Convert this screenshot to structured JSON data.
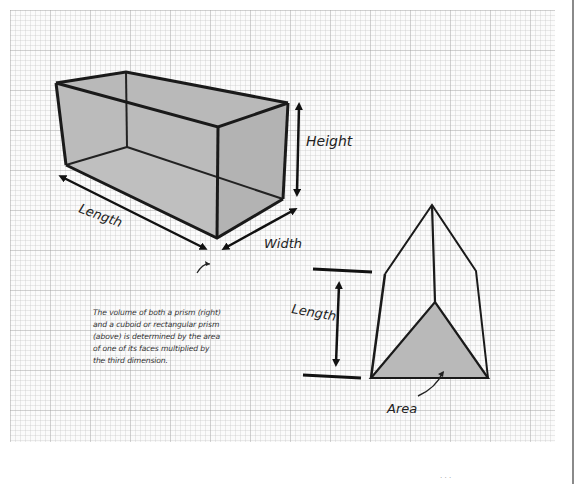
{
  "figure": {
    "colors": {
      "background": "#ffffff",
      "grid_paper": "#fbfbfb",
      "face_fill": "#b9b9b9",
      "outline": "#1a1a1a",
      "edge_rule": "#8a8a8a"
    },
    "cuboid": {
      "labels": {
        "height": "Height",
        "length": "Length",
        "width": "Width"
      }
    },
    "triangular_prism": {
      "labels": {
        "length": "Length",
        "area": "Area"
      }
    },
    "caption": {
      "lines": [
        "The volume of both a prism (right)",
        "and a cuboid or rectangular prism",
        "(above) is determined by the area",
        "of one of its faces multiplied by",
        "the third dimension."
      ]
    },
    "footer_fragment": "· · ·"
  }
}
